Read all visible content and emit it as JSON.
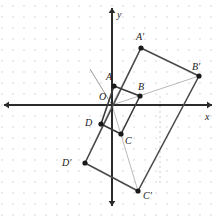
{
  "figure": {
    "background_color": "#ffffff",
    "grid": {
      "type": "dot-grid",
      "visible": true,
      "spacing_px": 11,
      "dot_color": "#e2e0e6",
      "dot_radius_px": 0.9,
      "origin_px": {
        "x": 112,
        "y": 105
      }
    },
    "axes": {
      "x": {
        "label": "x",
        "label_pos": {
          "x": 205,
          "y": 112
        },
        "color": "#2b2b2b",
        "y_px": 105,
        "from_px": 4,
        "to_px": 212,
        "arrows": "both"
      },
      "y": {
        "label": "y",
        "label_pos": {
          "x": 117,
          "y": 10
        },
        "color": "#2b2b2b",
        "x_px": 112,
        "from_px": 8,
        "to_px": 206,
        "arrows": "both"
      }
    },
    "stroke_colors": {
      "shape": "#3a3a3a",
      "image_shape": "#4a4a4a",
      "construction_ray": "#b9b9b9",
      "dashed_guide": "#c9c9c9",
      "point_fill": "#1a1a1a"
    }
  },
  "points": [
    {
      "name": "O",
      "label": "O",
      "px": {
        "x": 112,
        "y": 105
      },
      "label_px": {
        "x": 99,
        "y": 92
      },
      "dot": false,
      "role": "center-of-dilation"
    },
    {
      "name": "A",
      "label": "A",
      "px": {
        "x": 114,
        "y": 86
      },
      "label_px": {
        "x": 106,
        "y": 72
      },
      "dot": true,
      "role": "preimage-vertex"
    },
    {
      "name": "B",
      "label": "B",
      "px": {
        "x": 140,
        "y": 96
      },
      "label_px": {
        "x": 138,
        "y": 82
      },
      "dot": true,
      "role": "preimage-vertex"
    },
    {
      "name": "C",
      "label": "C",
      "px": {
        "x": 121,
        "y": 134
      },
      "label_px": {
        "x": 125,
        "y": 136
      },
      "dot": true,
      "role": "preimage-vertex"
    },
    {
      "name": "D",
      "label": "D",
      "px": {
        "x": 101,
        "y": 124
      },
      "label_px": {
        "x": 85,
        "y": 118
      },
      "dot": true,
      "role": "preimage-vertex"
    },
    {
      "name": "A2",
      "label": "A′",
      "px": {
        "x": 141,
        "y": 48
      },
      "label_px": {
        "x": 136,
        "y": 32
      },
      "dot": true,
      "role": "image-vertex"
    },
    {
      "name": "B2",
      "label": "B′",
      "px": {
        "x": 199,
        "y": 76
      },
      "label_px": {
        "x": 192,
        "y": 62
      },
      "dot": true,
      "role": "image-vertex"
    },
    {
      "name": "C2",
      "label": "C′",
      "px": {
        "x": 138,
        "y": 191
      },
      "label_px": {
        "x": 143,
        "y": 191
      },
      "dot": true,
      "role": "image-vertex"
    },
    {
      "name": "D2",
      "label": "D′",
      "px": {
        "x": 85,
        "y": 163
      },
      "label_px": {
        "x": 62,
        "y": 158
      },
      "dot": true,
      "role": "image-vertex"
    }
  ],
  "preimage_polygon": {
    "name": "ABCD",
    "vertex_names": [
      "A",
      "B",
      "C",
      "D"
    ]
  },
  "image_polygon": {
    "name": "A'B'C'D'",
    "vertex_names": [
      "A2",
      "B2",
      "C2",
      "D2"
    ]
  },
  "construction_rays": [
    {
      "name": "ray-O-A2",
      "from": "O",
      "to": "A2"
    },
    {
      "name": "ray-O-B2",
      "from": "O",
      "to": "B2"
    },
    {
      "name": "ray-O-C2",
      "from": "O",
      "to": "C2"
    },
    {
      "name": "ray-O-D2",
      "from": "O",
      "to": "D2"
    }
  ],
  "extra_marks": [
    {
      "name": "pointer-ray-upper-left",
      "from_px": {
        "x": 112,
        "y": 105
      },
      "to_px": {
        "x": 90,
        "y": 69
      },
      "color": "#9a9a9a"
    },
    {
      "name": "dashed-guide-vertical",
      "from_px": {
        "x": 160,
        "y": 96
      },
      "to_px": {
        "x": 160,
        "y": 186
      },
      "color": "#cccccc"
    }
  ],
  "chart_data": {
    "type": "scatter",
    "xlabel": "x",
    "ylabel": "y",
    "grid": true,
    "legend": "none",
    "unit_px": 11,
    "origin_px": {
      "x": 112,
      "y": 105
    },
    "xlim": [
      -10,
      9
    ],
    "ylim": [
      -9,
      9
    ],
    "annotations": [
      "O",
      "A",
      "B",
      "C",
      "D",
      "A′",
      "B′",
      "C′",
      "D′",
      "x",
      "y"
    ],
    "series": [
      {
        "name": "Preimage ABCD",
        "labels": [
          "A",
          "B",
          "C",
          "D"
        ],
        "x": [
          0.18,
          2.55,
          0.82,
          -1.0
        ],
        "y": [
          1.73,
          0.82,
          -2.64,
          -1.73
        ]
      },
      {
        "name": "Image A'B'C'D'",
        "labels": [
          "A′",
          "B′",
          "C′",
          "D′"
        ],
        "x": [
          2.64,
          7.91,
          2.36,
          -2.45
        ],
        "y": [
          5.18,
          2.64,
          -7.82,
          -5.27
        ]
      }
    ],
    "scale_factor": 2,
    "center_of_dilation": {
      "label": "O",
      "x": 0,
      "y": 0
    }
  }
}
